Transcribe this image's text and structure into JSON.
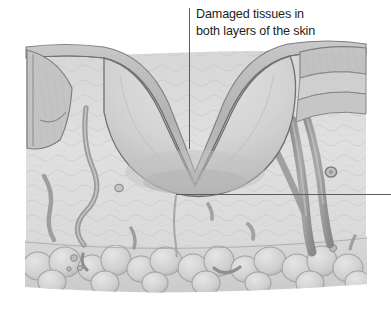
{
  "figure": {
    "title_line_1": "Damaged tissues in",
    "title_line_2": "both layers of the skin",
    "callout_text": "Damaged tissues in\nboth layers of the skin",
    "style": "grayscale medical illustration",
    "background_color": "#ffffff",
    "label_color": "#1d1d1d",
    "leader_line_color": "#5c5c5c"
  },
  "leaders": {
    "vertical": {
      "x": 189,
      "y_top": 8,
      "y_bottom": 149,
      "points_to": "crater interior / damaged tissue"
    },
    "horizontal": {
      "y": 194,
      "x_left": 176,
      "x_right": 391,
      "points_to": "base of wound crater"
    }
  },
  "anatomy": {
    "layers": [
      {
        "name": "epidermis",
        "label": "epidermis",
        "color": "#b9b9b9"
      },
      {
        "name": "dermis",
        "label": "dermis",
        "color": "#dcdcdc"
      },
      {
        "name": "subcutaneous-fat",
        "label": "subcutaneous fat",
        "color": "#d5d5d5"
      }
    ],
    "features": [
      {
        "name": "wound-crater",
        "label": "crater wound"
      },
      {
        "name": "blood-vessel",
        "label": "blood vessel"
      },
      {
        "name": "hair-follicle",
        "label": "hair follicle"
      },
      {
        "name": "fat-lobule",
        "label": "fat lobule"
      }
    ]
  },
  "palette": {
    "skin_light": "#e4e4e4",
    "skin_mid": "#cdcdcd",
    "skin_dark": "#a6a6a6",
    "outline": "#7a7a7a",
    "vessel": "#9a9a9a",
    "vessel_dark": "#7e7e7e",
    "crater_fill": "#d4d4d4",
    "crater_shadow": "#bdbdbd"
  }
}
